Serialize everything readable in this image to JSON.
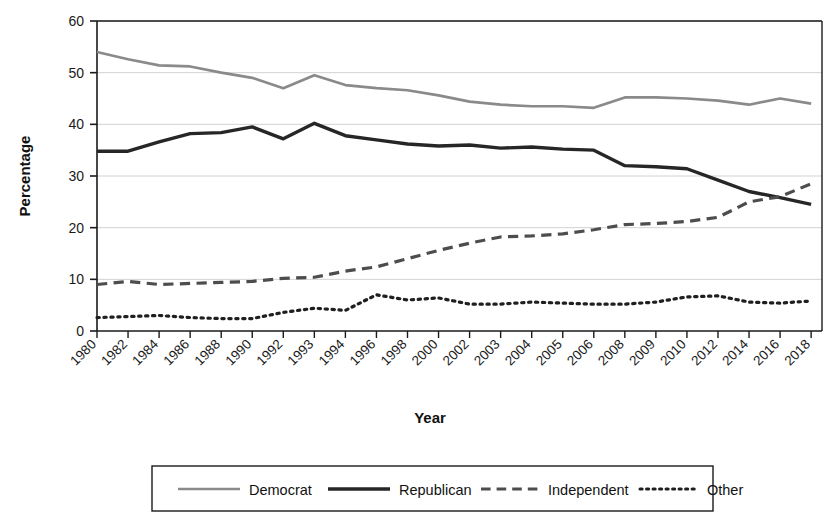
{
  "chart_data": {
    "type": "line",
    "title": "",
    "xlabel": "Year",
    "ylabel": "Percentage",
    "ylim": [
      0,
      60
    ],
    "yticks": [
      0,
      10,
      20,
      30,
      40,
      50,
      60
    ],
    "grid": "horizontal",
    "legend_position": "bottom",
    "categories": [
      "1980",
      "1982",
      "1984",
      "1986",
      "1988",
      "1990",
      "1992",
      "1993",
      "1994",
      "1996",
      "1998",
      "2000",
      "2002",
      "2003",
      "2004",
      "2005",
      "2006",
      "2008",
      "2009",
      "2010",
      "2012",
      "2014",
      "2016",
      "2018"
    ],
    "series": [
      {
        "name": "Democrat",
        "style": "solid",
        "color": "#8a8a8a",
        "values": [
          54.0,
          52.6,
          51.4,
          51.2,
          50.0,
          49.0,
          47.0,
          49.5,
          47.6,
          47.0,
          46.6,
          45.6,
          44.4,
          43.8,
          43.5,
          43.5,
          43.2,
          45.2,
          45.2,
          45.0,
          44.6,
          43.8,
          45.0,
          44.0
        ]
      },
      {
        "name": "Republican",
        "style": "solid",
        "color": "#262626",
        "values": [
          34.8,
          34.8,
          36.6,
          38.2,
          38.4,
          39.5,
          37.2,
          40.2,
          37.8,
          37.0,
          36.2,
          35.8,
          36.0,
          35.4,
          35.6,
          35.2,
          35.0,
          32.0,
          31.8,
          31.4,
          29.2,
          27.0,
          25.8,
          24.5
        ]
      },
      {
        "name": "Independent",
        "style": "dashed",
        "color": "#4d4d4d",
        "values": [
          9.0,
          9.6,
          9.0,
          9.2,
          9.4,
          9.6,
          10.2,
          10.4,
          11.6,
          12.4,
          14.0,
          15.6,
          17.0,
          18.2,
          18.4,
          18.8,
          19.6,
          20.6,
          20.8,
          21.2,
          22.0,
          25.0,
          26.0,
          28.5
        ]
      },
      {
        "name": "Other",
        "style": "dotted",
        "color": "#1f1f1f",
        "values": [
          2.6,
          2.8,
          3.0,
          2.6,
          2.4,
          2.4,
          3.6,
          4.4,
          4.0,
          7.0,
          6.0,
          6.4,
          5.2,
          5.2,
          5.6,
          5.4,
          5.2,
          5.2,
          5.6,
          6.6,
          6.8,
          5.6,
          5.4,
          5.8
        ]
      }
    ]
  },
  "axes": {
    "y_title": "Percentage",
    "x_title": "Year",
    "y_tick_labels": [
      "0",
      "10",
      "20",
      "30",
      "40",
      "50",
      "60"
    ],
    "x_tick_labels": [
      "1980",
      "1982",
      "1984",
      "1986",
      "1988",
      "1990",
      "1992",
      "1993",
      "1994",
      "1996",
      "1998",
      "2000",
      "2002",
      "2003",
      "2004",
      "2005",
      "2006",
      "2008",
      "2009",
      "2010",
      "2012",
      "2014",
      "2016",
      "2018"
    ]
  },
  "legend": {
    "items": [
      {
        "label": "Democrat",
        "style": "solid",
        "color": "#8a8a8a",
        "width": 2.6
      },
      {
        "label": "Republican",
        "style": "solid",
        "color": "#262626",
        "width": 3.4
      },
      {
        "label": "Independent",
        "style": "dashed",
        "color": "#4d4d4d",
        "width": 3.0
      },
      {
        "label": "Other",
        "style": "dotted",
        "color": "#1f1f1f",
        "width": 3.0
      }
    ]
  }
}
